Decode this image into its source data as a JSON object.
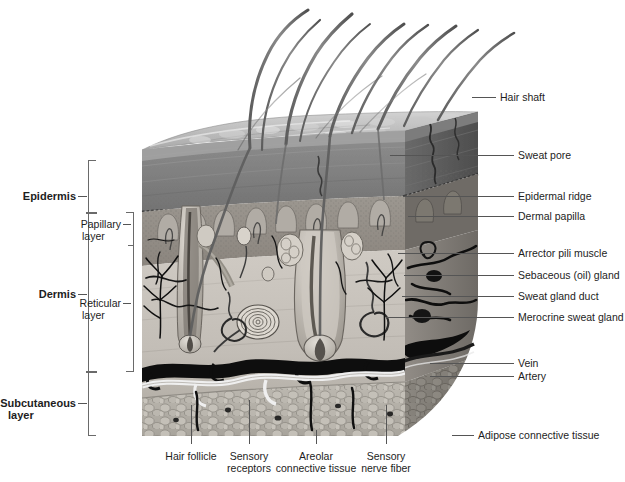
{
  "figure": {
    "type": "anatomical-cross-section-diagram",
    "colors": {
      "label_text": "#1d1d1d",
      "leader_line": "#555555",
      "bracket": "#6a6a6a",
      "background": "#ffffff",
      "epidermis_surface": "#b9b9b9",
      "epidermis_cut": "#8e8e8e",
      "dermis": "#c9c5bf",
      "dermis_cut": "#7e7a76",
      "subcutaneous": "#b2aea6",
      "hair": "#6e6e6e",
      "vessel_dark": "#1a1a1a"
    }
  },
  "left_brackets": {
    "epidermis": {
      "label": "Epidermis",
      "top": 160,
      "bottom": 212
    },
    "dermis": {
      "label": "Dermis",
      "top": 212,
      "bottom": 372
    },
    "subcutaneous": {
      "label_line1": "Subcutaneous",
      "label_line2": "layer",
      "top": 372,
      "bottom": 436
    },
    "sublayers": [
      {
        "label_line1": "Papillary",
        "label_line2": "layer",
        "top": 212,
        "bottom": 246
      },
      {
        "label_line1": "Reticular",
        "label_line2": "layer",
        "top": 246,
        "bottom": 372
      }
    ]
  },
  "right_labels": [
    {
      "text": "Hair shaft",
      "y": 97,
      "line_x1": 472,
      "line_x2": 496,
      "anchor_y": 97
    },
    {
      "text": "Sweat pore",
      "y": 155,
      "line_x1": 390,
      "line_x2": 514,
      "anchor_y": 155
    },
    {
      "text": "Epidermal ridge",
      "y": 196,
      "line_x1": 403,
      "line_x2": 514,
      "anchor_y": 196
    },
    {
      "text": "Dermal papilla",
      "y": 216,
      "line_x1": 408,
      "line_x2": 514,
      "anchor_y": 216
    },
    {
      "text": "Arrector pili muscle",
      "y": 253,
      "line_x1": 398,
      "line_x2": 514,
      "anchor_y": 253
    },
    {
      "text": "Sebaceous (oil) gland",
      "y": 275,
      "line_x1": 404,
      "line_x2": 514,
      "anchor_y": 275
    },
    {
      "text": "Sweat gland duct",
      "y": 296,
      "line_x1": 402,
      "line_x2": 514,
      "anchor_y": 296
    },
    {
      "text": "Merocrine sweat gland",
      "y": 317,
      "line_x1": 386,
      "line_x2": 514,
      "anchor_y": 317
    },
    {
      "text": "Vein",
      "y": 363,
      "line_x1": 430,
      "line_x2": 514,
      "anchor_y": 363
    },
    {
      "text": "Artery",
      "y": 376,
      "line_x1": 430,
      "line_x2": 514,
      "anchor_y": 376
    },
    {
      "text": "Adipose connective tissue",
      "y": 435,
      "line_x1": 452,
      "line_x2": 470,
      "anchor_y": 435
    }
  ],
  "bottom_labels": [
    {
      "line1": "Hair follicle",
      "line2": "",
      "x": 191,
      "tick_top": 405,
      "tick_bottom": 444
    },
    {
      "line1": "Sensory",
      "line2": "receptors",
      "x": 249,
      "tick_top": 400,
      "tick_bottom": 444
    },
    {
      "line1": "Areolar",
      "line2": "connective tissue",
      "x": 316,
      "tick_top": 430,
      "tick_bottom": 444
    },
    {
      "line1": "Sensory",
      "line2": "nerve fiber",
      "x": 386,
      "tick_top": 405,
      "tick_bottom": 444
    }
  ],
  "block": {
    "left": 142,
    "right": 478,
    "top": 112,
    "bottom": 436,
    "surface_label": "epidermal surface with hair shafts",
    "hair_count": 9
  }
}
